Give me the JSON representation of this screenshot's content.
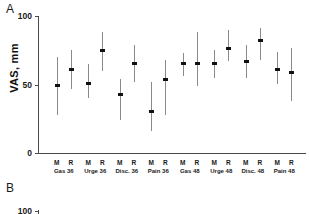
{
  "figure": {
    "panels": [
      {
        "letter": "A"
      },
      {
        "letter": "B"
      }
    ]
  },
  "panel_a": {
    "ylabel": "VAS, mm",
    "yticks": [
      "0",
      "50",
      "100"
    ]
  },
  "panel_b": {
    "ytick_top": "100"
  },
  "chart_data": {
    "type": "scatter",
    "title": "",
    "subtitle": "",
    "xlabel": "",
    "ylabel": "VAS, mm",
    "ylim": [
      0,
      100
    ],
    "yticks": [
      0,
      50,
      100
    ],
    "grid": false,
    "legend": null,
    "error_bar_type": "95% CI",
    "point_labels": [
      "M",
      "R"
    ],
    "groups": [
      {
        "name": "Gas 36",
        "points": [
          {
            "label": "M",
            "value": 49,
            "low": 28,
            "high": 70
          },
          {
            "label": "R",
            "value": 61,
            "low": 47,
            "high": 75
          }
        ]
      },
      {
        "name": "Urge 36",
        "points": [
          {
            "label": "M",
            "value": 51,
            "low": 40,
            "high": 65
          },
          {
            "label": "R",
            "value": 75,
            "low": 60,
            "high": 88
          }
        ]
      },
      {
        "name": "Disc. 36",
        "points": [
          {
            "label": "M",
            "value": 43,
            "low": 24,
            "high": 54
          },
          {
            "label": "R",
            "value": 65,
            "low": 52,
            "high": 79
          }
        ]
      },
      {
        "name": "Pain 36",
        "points": [
          {
            "label": "M",
            "value": 30,
            "low": 16,
            "high": 52
          },
          {
            "label": "R",
            "value": 54,
            "low": 28,
            "high": 68
          }
        ]
      },
      {
        "name": "Gas 48",
        "points": [
          {
            "label": "M",
            "value": 65,
            "low": 56,
            "high": 73
          },
          {
            "label": "R",
            "value": 65,
            "low": 49,
            "high": 88
          }
        ]
      },
      {
        "name": "Urge 48",
        "points": [
          {
            "label": "M",
            "value": 65,
            "low": 55,
            "high": 75
          },
          {
            "label": "R",
            "value": 76,
            "low": 67,
            "high": 90
          }
        ]
      },
      {
        "name": "Disc. 48",
        "points": [
          {
            "label": "M",
            "value": 67,
            "low": 55,
            "high": 79
          },
          {
            "label": "R",
            "value": 82,
            "low": 68,
            "high": 91
          }
        ]
      },
      {
        "name": "Pain 48",
        "points": [
          {
            "label": "M",
            "value": 61,
            "low": 50,
            "high": 74
          },
          {
            "label": "R",
            "value": 59,
            "low": 38,
            "high": 77
          }
        ]
      }
    ]
  }
}
